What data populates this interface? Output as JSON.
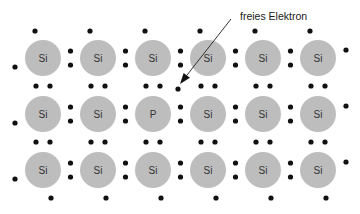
{
  "annotation": {
    "label": "freies Elektron",
    "label_x": 240,
    "label_y": 20,
    "arrow_from": [
      231,
      19
    ],
    "arrow_to": [
      180,
      84
    ]
  },
  "colors": {
    "atom_fill": "#bdbdbd",
    "electron": "#111111",
    "text": "#333333"
  },
  "lattice": {
    "columns_x": [
      43,
      98,
      153,
      208,
      263,
      318
    ],
    "rows_y": [
      58,
      114,
      170
    ],
    "atom_radius": 18,
    "atoms": [
      [
        "Si",
        "Si",
        "Si",
        "Si",
        "Si",
        "Si"
      ],
      [
        "Si",
        "Si",
        "P",
        "Si",
        "Si",
        "Si"
      ],
      [
        "Si",
        "Si",
        "Si",
        "Si",
        "Si",
        "Si"
      ]
    ]
  },
  "free_electron": {
    "x": 178,
    "y": 89
  }
}
